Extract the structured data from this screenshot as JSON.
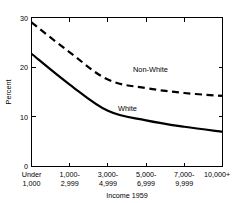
{
  "chart_data": {
    "type": "line",
    "title": "",
    "xlabel": "Income 1959",
    "ylabel": "Percent",
    "categories": [
      "Under 1,000",
      "1,000-2,999",
      "3,000-4,999",
      "5,000-6,999",
      "7,000-9,999",
      "10,000+"
    ],
    "category_lines": [
      [
        "Under",
        "1,000"
      ],
      [
        "1,000-",
        "2,999"
      ],
      [
        "3,000-",
        "4,999"
      ],
      [
        "5,000-",
        "6,999"
      ],
      [
        "7,000-",
        "9,999"
      ],
      [
        "10,000+",
        ""
      ]
    ],
    "series": [
      {
        "name": "Non-White",
        "style": "dashed",
        "values": [
          29.0,
          23.0,
          17.5,
          15.8,
          14.8,
          14.2
        ]
      },
      {
        "name": "White",
        "style": "solid",
        "values": [
          22.7,
          16.5,
          11.2,
          9.3,
          8.0,
          7.0
        ]
      }
    ],
    "ylim": [
      0,
      30
    ],
    "yticks": [
      0,
      10,
      20,
      30
    ],
    "ytick_labels": [
      "0",
      "10",
      "20",
      "30"
    ],
    "grid": false,
    "legend": "inline-annotations",
    "annotations": [
      {
        "text": "Non-White",
        "series": "Non-White"
      },
      {
        "text": "White",
        "series": "White"
      }
    ],
    "colors": {
      "axis": "#000000",
      "series_non_white": "#000000",
      "series_white": "#000000",
      "background": "#ffffff"
    }
  }
}
